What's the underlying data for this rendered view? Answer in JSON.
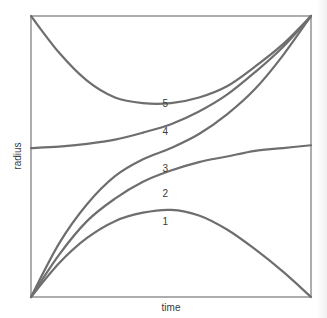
{
  "chart_data": {
    "type": "line",
    "title": "",
    "xlabel": "time",
    "ylabel": "radius",
    "xlim": [
      0,
      1
    ],
    "ylim": [
      0,
      1
    ],
    "grid": false,
    "legend": "inline numeric labels placed near the center of each curve",
    "x": [
      0,
      0.1,
      0.2,
      0.3,
      0.4,
      0.5,
      0.6,
      0.7,
      0.8,
      0.9,
      1.0
    ],
    "series": [
      {
        "name": "1",
        "label": "1",
        "values": [
          0.0,
          0.12,
          0.21,
          0.27,
          0.3,
          0.31,
          0.29,
          0.24,
          0.17,
          0.09,
          0.0
        ]
      },
      {
        "name": "2",
        "label": "2",
        "values": [
          0.0,
          0.15,
          0.27,
          0.35,
          0.41,
          0.45,
          0.48,
          0.5,
          0.52,
          0.53,
          0.54
        ]
      },
      {
        "name": "3",
        "label": "3",
        "values": [
          0.0,
          0.19,
          0.33,
          0.43,
          0.49,
          0.53,
          0.58,
          0.65,
          0.74,
          0.86,
          1.0
        ]
      },
      {
        "name": "4",
        "label": "4",
        "values": [
          0.53,
          0.535,
          0.545,
          0.56,
          0.585,
          0.615,
          0.66,
          0.72,
          0.8,
          0.89,
          1.0
        ]
      },
      {
        "name": "5",
        "label": "5",
        "values": [
          1.0,
          0.87,
          0.77,
          0.71,
          0.69,
          0.69,
          0.71,
          0.75,
          0.82,
          0.9,
          1.0
        ]
      }
    ],
    "label_positions": [
      {
        "series": "1",
        "x": 0.48,
        "y": 0.27
      },
      {
        "series": "2",
        "x": 0.48,
        "y": 0.37
      },
      {
        "series": "3",
        "x": 0.48,
        "y": 0.46
      },
      {
        "series": "4",
        "x": 0.48,
        "y": 0.59
      },
      {
        "series": "5",
        "x": 0.48,
        "y": 0.69
      }
    ],
    "colors": {
      "curve": "#6e6e6e",
      "frame": "#8a8a8a",
      "text": "#3a3a3a",
      "background": "#ffffff"
    }
  }
}
